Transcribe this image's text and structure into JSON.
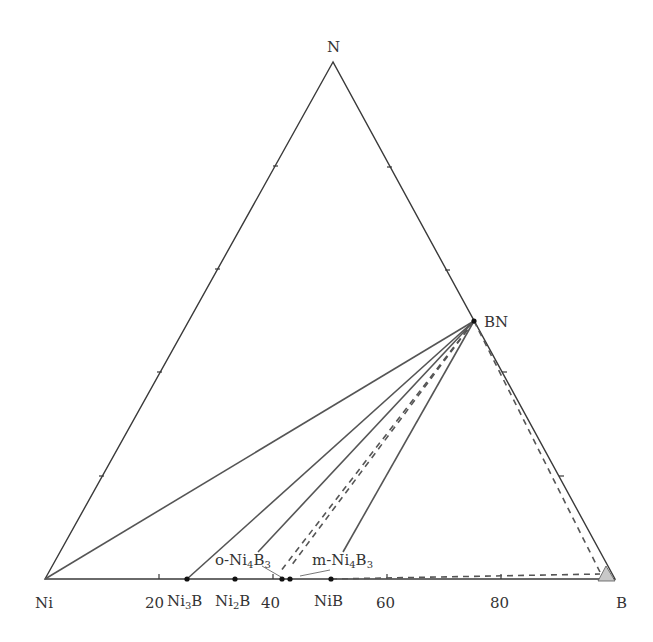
{
  "diagram": {
    "type": "ternary-phase-diagram",
    "vertices": {
      "top": {
        "label": "N",
        "x": 333,
        "y": 62
      },
      "left": {
        "label": "Ni",
        "x": 45,
        "y": 579
      },
      "right": {
        "label": "B",
        "x": 615,
        "y": 579
      }
    },
    "base_axis_ticks": [
      "20",
      "40",
      "60",
      "80"
    ],
    "phases": [
      {
        "name": "Ni3B",
        "display": [
          "Ni",
          "3",
          "B",
          ""
        ],
        "at_percent_B": 25
      },
      {
        "name": "Ni2B",
        "display": [
          "Ni",
          "2",
          "B",
          ""
        ],
        "at_percent_B": 33.3
      },
      {
        "name": "o-Ni4B3",
        "display": [
          "o-Ni",
          "4",
          "B",
          "3"
        ],
        "at_percent_B": 42.1
      },
      {
        "name": "m-Ni4B3",
        "display": [
          "m-Ni",
          "4",
          "B",
          "3"
        ],
        "at_percent_B": 43.5
      },
      {
        "name": "NiB",
        "display": [
          "NiB",
          "",
          "",
          ""
        ],
        "at_percent_B": 50
      },
      {
        "name": "BN",
        "display": [
          "BN",
          "",
          "",
          ""
        ],
        "position": "midpoint B-N edge"
      }
    ],
    "tie_lines": [
      {
        "from": "BN",
        "to": "Ni",
        "style": "solid"
      },
      {
        "from": "BN",
        "to": "Ni3B",
        "style": "solid"
      },
      {
        "from": "BN",
        "to": "Ni2B",
        "style": "solid"
      },
      {
        "from": "BN",
        "to": "o-Ni4B3",
        "style": "dashed"
      },
      {
        "from": "BN",
        "to": "m-Ni4B3",
        "style": "dashed"
      },
      {
        "from": "BN",
        "to": "NiB",
        "style": "solid"
      },
      {
        "from": "BN",
        "to": "B-region",
        "style": "dashed"
      },
      {
        "from": "NiB",
        "to": "B-region",
        "style": "dashed"
      }
    ],
    "colors": {
      "edge": "#3a3a3a",
      "tie_line": "#555555",
      "point": "#111111",
      "b_region_fill": "#c8c8c8"
    }
  }
}
